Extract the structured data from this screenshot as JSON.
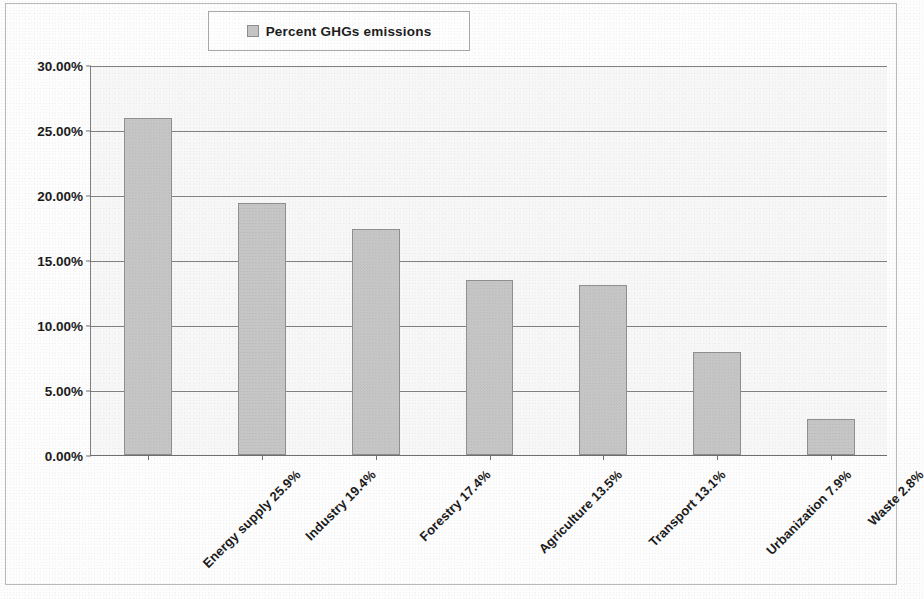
{
  "legend": {
    "swatch_color": "#c4c4c4",
    "label": "Percent GHGs emissions"
  },
  "axis": {
    "y_ticks": [
      "30.00%",
      "25.00%",
      "20.00%",
      "15.00%",
      "10.00%",
      "5.00%",
      "0.00%"
    ]
  },
  "chart_data": {
    "type": "bar",
    "title": "",
    "subtitle": "",
    "xlabel": "",
    "ylabel": "",
    "ylim": [
      0,
      30
    ],
    "y_tick_values": [
      0,
      5,
      10,
      15,
      20,
      25,
      30
    ],
    "y_tick_labels": [
      "0.00%",
      "5.00%",
      "10.00%",
      "15.00%",
      "20.00%",
      "25.00%",
      "30.00%"
    ],
    "grid": true,
    "legend_position": "top-center",
    "series": [
      {
        "name": "Percent GHGs emissions",
        "color": "#c6c6c6",
        "values": [
          25.9,
          19.4,
          17.4,
          13.5,
          13.1,
          7.9,
          2.8
        ]
      }
    ],
    "categories": [
      "Energy supply 25.9%",
      "Industry 19.4%",
      "Forestry 17.4%",
      "Agriculture 13.5%",
      "Transport 13.1%",
      "Urbanization 7.9%",
      "Waste 2.8%"
    ],
    "category_names": [
      "Energy supply",
      "Industry",
      "Forestry",
      "Agriculture",
      "Transport",
      "Urbanization",
      "Waste"
    ],
    "values": [
      25.9,
      19.4,
      17.4,
      13.5,
      13.1,
      7.9,
      2.8
    ]
  }
}
